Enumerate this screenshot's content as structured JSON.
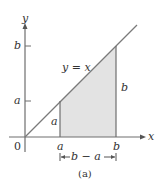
{
  "figure": {
    "caption": "(a)",
    "colors": {
      "line": "#7a7a7a",
      "axis": "#6e6e6e",
      "shade": "#e3e3e3",
      "text": "#333333"
    },
    "axes": {
      "x_label": "x",
      "y_label": "y",
      "origin_label": "0"
    },
    "line_label": "y = x",
    "ticks": {
      "x": [
        "a",
        "b"
      ],
      "y": [
        "a",
        "b"
      ]
    },
    "side_labels": {
      "left_height": "a",
      "right_height": "b",
      "width": "b − a"
    }
  }
}
